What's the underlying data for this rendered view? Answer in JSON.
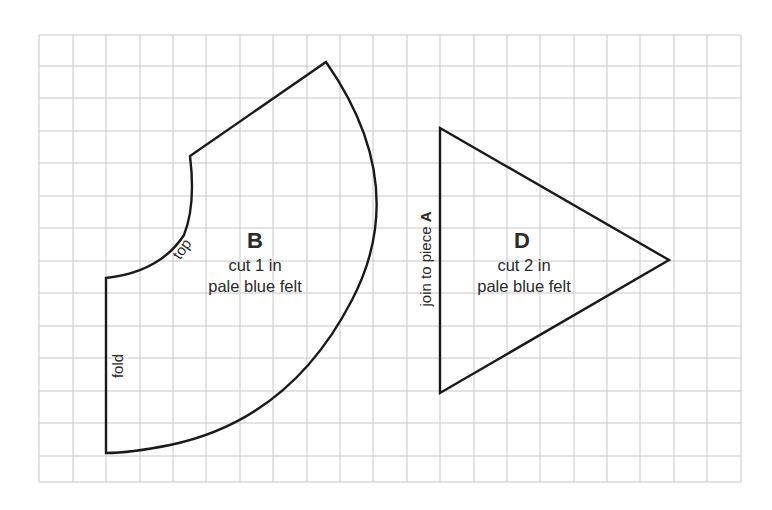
{
  "diagram": {
    "type": "sewing-pattern",
    "grid": {
      "x_lines": [
        39,
        73,
        106,
        140,
        173,
        206,
        240,
        273,
        307,
        340,
        373,
        407,
        440,
        474,
        507,
        540,
        574,
        607,
        640,
        674,
        707,
        741
      ],
      "y_lines": [
        35,
        66,
        98,
        131,
        163,
        196,
        228,
        261,
        293,
        326,
        358,
        391,
        423,
        456,
        482
      ],
      "color": "#c8c8c8"
    },
    "outline_color": "#1a1a1a",
    "pieces": [
      {
        "id": "B",
        "letter": "B",
        "instruction_line1": "cut 1 in",
        "instruction_line2": "pale blue felt",
        "edge_labels": {
          "top": "top",
          "fold": "fold"
        }
      },
      {
        "id": "D",
        "letter": "D",
        "instruction_line1": "cut 2 in",
        "instruction_line2": "pale blue felt",
        "edge_labels": {
          "join": "join to piece ",
          "join_piece": "A"
        }
      }
    ]
  }
}
